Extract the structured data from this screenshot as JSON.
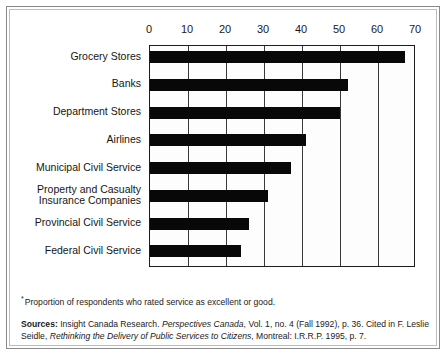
{
  "chart_data": {
    "type": "bar",
    "orientation": "horizontal",
    "title": "",
    "subtitle": "",
    "xlabel": "",
    "ylabel": "",
    "xlim": [
      0,
      70
    ],
    "ylim": null,
    "grid": true,
    "legend": null,
    "legend_position": "none",
    "categories": [
      "Grocery Stores",
      "Banks",
      "Department Stores",
      "Airlines",
      "Municipal Civil Service",
      "Property and Casualty\nInsurance Companies",
      "Provincial Civil Service",
      "Federal Civil Service"
    ],
    "values": [
      67,
      52,
      50,
      41,
      37,
      31,
      26,
      24
    ],
    "tick_labels": [
      "0",
      "10",
      "20",
      "30",
      "40",
      "50",
      "60",
      "70"
    ],
    "tick_values": [
      0,
      10,
      20,
      30,
      40,
      50,
      60,
      70
    ],
    "bar_color": "#080808",
    "axis_color": "#1d1d1d",
    "annotations": [
      "Proportion of respondents who rated service as excellent or good."
    ]
  },
  "axis": {
    "ticks": [
      {
        "label": "0",
        "value": 0
      },
      {
        "label": "10",
        "value": 10
      },
      {
        "label": "20",
        "value": 20
      },
      {
        "label": "30",
        "value": 30
      },
      {
        "label": "40",
        "value": 40
      },
      {
        "label": "50",
        "value": 50
      },
      {
        "label": "60",
        "value": 60
      },
      {
        "label": "70",
        "value": 70
      }
    ]
  },
  "footnote": {
    "marker": "*",
    "text": "Proportion of respondents who rated service as excellent or good."
  },
  "sources": {
    "label": "Sources:",
    "part1": " Insight Canada Research. ",
    "italic1": "Perspectives Canada",
    "part2": ", Vol. 1, no. 4 (Fall 1992), p. 36. Cited in F. Leslie Seidle, ",
    "italic2": "Rethinking the Delivery of Public Services to Citizens",
    "part3": ", Montreal: I.R.R.P. 1995, p. 7."
  }
}
